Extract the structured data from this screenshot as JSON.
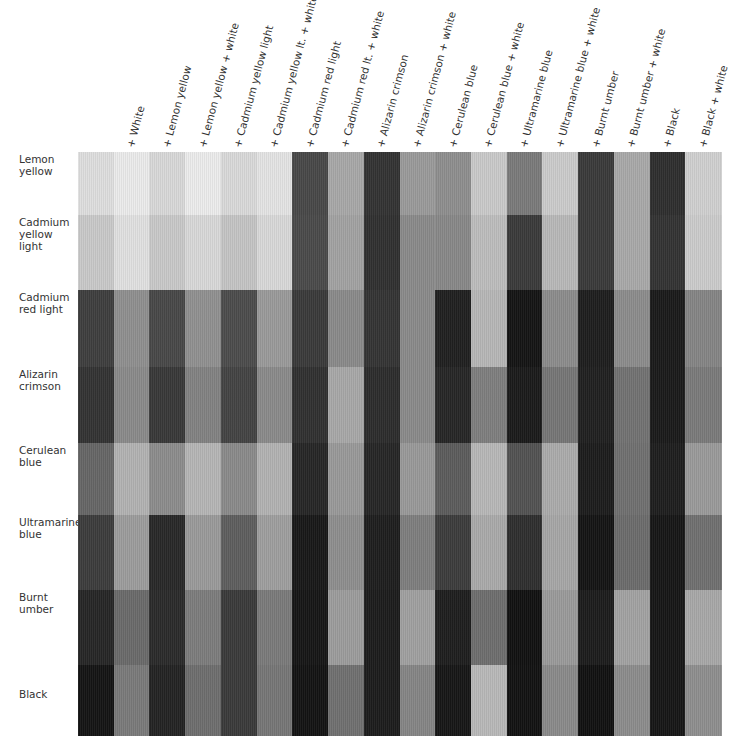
{
  "chart_data": {
    "type": "heatmap",
    "title": "",
    "columns": [
      "",
      "+ White",
      "+ Lemon yellow",
      "+ Lemon yellow + white",
      "+ Cadmium yellow light",
      "+ Cadmium yellow lt. + white",
      "+ Cadmium red light",
      "+ Cadmium red lt. + white",
      "+ Alizarin crimson",
      "+ Alizarin crimson + white",
      "+ Cerulean blue",
      "+ Cerulean blue + white",
      "+ Ultramarine blue",
      "+ Ultramarine blue + white",
      "+ Burnt umber",
      "+ Burnt umber + white",
      "+ Black",
      "+ Black + white"
    ],
    "rows": [
      {
        "label": "Lemon yellow",
        "lines": [
          "Lemon",
          "yellow"
        ],
        "values": [
          "#dedede",
          "#ebebeb",
          "#d8d8d8",
          "#ececec",
          "#d9d9d9",
          "#e4e4e4",
          "#484848",
          "#a8a8a8",
          "#333333",
          "#9a9a9a",
          "#8e8e8e",
          "#c9c9c9",
          "#7a7a7a",
          "#cbcbcb",
          "#3a3a3a",
          "#a9a9a9",
          "#2e2e2e",
          "#d0d0d0"
        ]
      },
      {
        "label": "Cadmium yellow light",
        "lines": [
          "Cadmium",
          "yellow light"
        ],
        "values": [
          "#c9c9c9",
          "#e0e0e0",
          "#c8c8c8",
          "#d8d8d8",
          "#c4c4c4",
          "#d8d8d8",
          "#4a4a4a",
          "#a2a2a2",
          "#303030",
          "#8a8a8a",
          "#888888",
          "#bdbdbd",
          "#3a3a3a",
          "#b8b8b8",
          "#3a3a3a",
          "#a9a9a9",
          "#333333",
          "#cbcbcb"
        ]
      },
      {
        "label": "Cadmium red light",
        "lines": [
          "Cadmium",
          "red light"
        ],
        "values": [
          "#3e3e3e",
          "#8f8f8f",
          "#484848",
          "#909090",
          "#4c4c4c",
          "#9a9a9a",
          "#3a3a3a",
          "#8a8a8a",
          "#343434",
          "#8a8a8a",
          "#202020",
          "#b6b6b6",
          "#141414",
          "#8c8c8c",
          "#1e1e1e",
          "#8c8c8c",
          "#1a1a1a",
          "#858585"
        ]
      },
      {
        "label": "Alizarin crimson",
        "lines": [
          "Alizarin",
          "crimson"
        ],
        "values": [
          "#333333",
          "#8a8a8a",
          "#383838",
          "#828282",
          "#434343",
          "#8a8a8a",
          "#303030",
          "#a8a8a8",
          "#2c2c2c",
          "#8a8a8a",
          "#262626",
          "#7e7e7e",
          "#1a1a1a",
          "#767676",
          "#202020",
          "#727272",
          "#1a1a1a",
          "#7a7a7a"
        ]
      },
      {
        "label": "Cerulean blue",
        "lines": [
          "Cerulean",
          "blue"
        ],
        "values": [
          "#666666",
          "#b2b2b2",
          "#8c8c8c",
          "#b5b5b5",
          "#8a8a8a",
          "#b2b2b2",
          "#262626",
          "#999999",
          "#262626",
          "#999999",
          "#5c5c5c",
          "#b7b7b7",
          "#525252",
          "#ababab",
          "#1c1c1c",
          "#707070",
          "#1e1e1e",
          "#9a9a9a"
        ]
      },
      {
        "label": "Ultramarine blue",
        "lines": [
          "Ultramarine",
          "blue"
        ],
        "values": [
          "#3c3c3c",
          "#9c9c9c",
          "#282828",
          "#9a9a9a",
          "#5e5e5e",
          "#9e9e9e",
          "#181818",
          "#8e8e8e",
          "#1e1e1e",
          "#7e7e7e",
          "#3c3c3c",
          "#aaaaaa",
          "#2e2e2e",
          "#a6a6a6",
          "#141414",
          "#6c6c6c",
          "#161616",
          "#707070"
        ]
      },
      {
        "label": "Burnt umber",
        "lines": [
          "Burnt",
          "umber"
        ],
        "values": [
          "#262626",
          "#6a6a6a",
          "#2a2a2a",
          "#7c7c7c",
          "#3a3a3a",
          "#7a7a7a",
          "#161616",
          "#9c9c9c",
          "#1c1c1c",
          "#a0a0a0",
          "#1e1e1e",
          "#6e6e6e",
          "#111111",
          "#9a9a9a",
          "#1c1c1c",
          "#a2a2a2",
          "#161616",
          "#a8a8a8"
        ]
      },
      {
        "label": "Black",
        "lines": [
          "Black",
          ""
        ],
        "values": [
          "#141414",
          "#7a7a7a",
          "#232323",
          "#6e6e6e",
          "#3a3a3a",
          "#767676",
          "#131313",
          "#707070",
          "#1c1c1c",
          "#858585",
          "#161616",
          "#b8b8b8",
          "#121212",
          "#8a8a8a",
          "#111111",
          "#8c8c8c",
          "#161616",
          "#8e8e8e"
        ]
      }
    ],
    "layout": {
      "grid_left": 78,
      "grid_top": 152,
      "grid_right": 721,
      "grid_bottom": 735,
      "row_bounds": [
        152,
        215,
        290,
        367,
        443,
        515,
        590,
        665,
        735
      ],
      "column_label_rotation_deg": -75
    }
  }
}
